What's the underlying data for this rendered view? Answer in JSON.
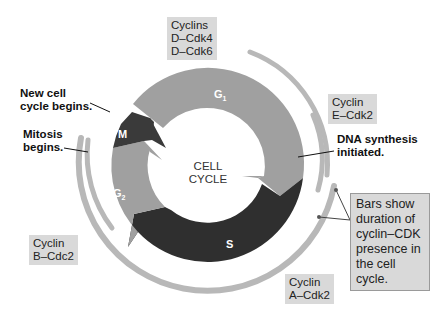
{
  "center_label": {
    "line1": "CELL",
    "line2": "CYCLE"
  },
  "phases": [
    {
      "name": "G1",
      "main": "G",
      "sub": "1",
      "color": "#9e9e9e"
    },
    {
      "name": "S",
      "main": "S",
      "sub": "",
      "color": "#2f2f2f"
    },
    {
      "name": "G2",
      "main": "G",
      "sub": "2",
      "color": "#9e9e9e"
    },
    {
      "name": "M",
      "main": "M",
      "sub": "",
      "color": "#3a3a3a"
    }
  ],
  "cyclin_labels": {
    "d": {
      "line1": "Cyclins",
      "line2": "D–Cdk4",
      "line3": "D–Cdk6"
    },
    "e": {
      "line1": "Cyclin",
      "line2": "E–Cdk2"
    },
    "a": {
      "line1": "Cyclin",
      "line2": "A–Cdk2"
    },
    "b": {
      "line1": "Cyclin",
      "line2": "B–Cdc2"
    }
  },
  "event_labels": {
    "new_cycle": {
      "line1": "New cell",
      "line2": "cycle begins."
    },
    "mitosis": {
      "line1": "Mitosis",
      "line2": "begins."
    },
    "dna": {
      "line1": "DNA synthesis",
      "line2": "initiated."
    }
  },
  "callout": {
    "line1": "Bars show",
    "line2": "duration of",
    "line3": "cyclin–CDK",
    "line4": "presence in",
    "line5": "the cell cycle."
  },
  "colors": {
    "light_phase": "#9e9e9e",
    "dark_phase": "#2f2f2f",
    "bar": "#b5b5b5",
    "label_bg": "#d9d9d9"
  }
}
